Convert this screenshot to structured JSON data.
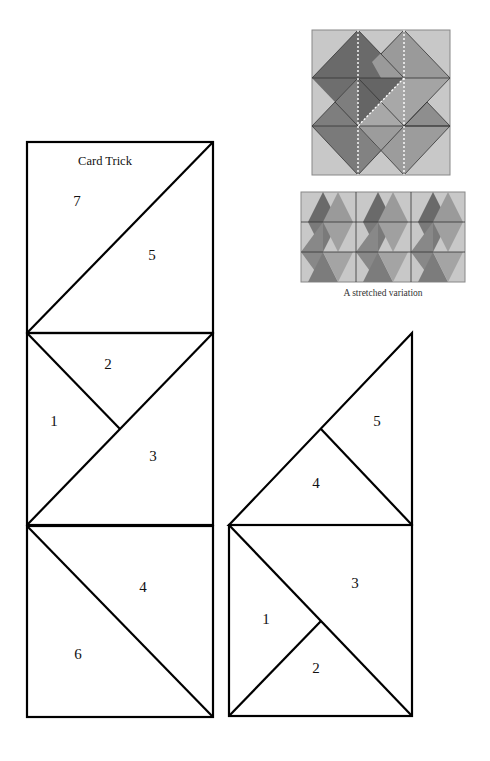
{
  "title": "Card Trick",
  "caption": "A stretched variation",
  "colors": {
    "background": "#ffffff",
    "stroke": "#000000",
    "block_bg": "#c8c8c8",
    "shade_dark": "#6a6a6a",
    "shade_medium": "#8c8c8c",
    "shade_light": "#a6a6a6"
  },
  "left_column": {
    "top_square": {
      "labels": [
        "7",
        "5"
      ]
    },
    "middle_square": {
      "labels": [
        "2",
        "1",
        "3"
      ]
    },
    "bottom_square": {
      "labels": [
        "4",
        "6"
      ]
    }
  },
  "right_column": {
    "triangle": {
      "labels": [
        "5",
        "4"
      ]
    },
    "square": {
      "labels": [
        "3",
        "1",
        "2"
      ]
    }
  },
  "labels": {
    "l7": "7",
    "l5": "5",
    "l2": "2",
    "l1": "1",
    "l3": "3",
    "l4": "4",
    "l6": "6",
    "r5": "5",
    "r4": "4",
    "r3": "3",
    "r1": "1",
    "r2": "2"
  }
}
